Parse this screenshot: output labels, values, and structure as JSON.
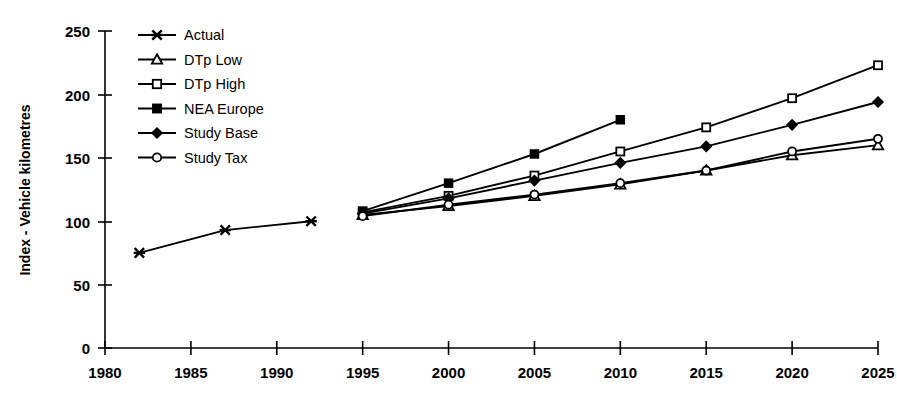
{
  "chart_data": {
    "type": "line",
    "title": "",
    "subtitle": "",
    "xlabel": "",
    "ylabel": "Index - Vehicle kilometres",
    "xlim": [
      1980,
      2025
    ],
    "ylim": [
      0,
      250
    ],
    "xticks": [
      1980,
      1985,
      1990,
      1995,
      2000,
      2005,
      2010,
      2015,
      2020,
      2025
    ],
    "yticks": [
      0,
      50,
      100,
      150,
      200,
      250
    ],
    "grid": false,
    "legend_position": "upper-left-inside",
    "series": [
      {
        "name": "Actual",
        "marker": "cross",
        "marker_style": "filled",
        "x": [
          1982,
          1987,
          1992
        ],
        "values": [
          75,
          93,
          100
        ]
      },
      {
        "name": "DTp Low",
        "marker": "triangle",
        "marker_style": "open",
        "x": [
          1995,
          2000,
          2005,
          2010,
          2015,
          2020,
          2025
        ],
        "values": [
          105,
          112,
          120,
          129,
          140,
          152,
          160
        ]
      },
      {
        "name": "DTp High",
        "marker": "square",
        "marker_style": "open",
        "x": [
          1995,
          2000,
          2005,
          2010,
          2015,
          2020,
          2025
        ],
        "values": [
          107,
          120,
          136,
          155,
          174,
          197,
          223
        ]
      },
      {
        "name": "NEA Europe",
        "marker": "square",
        "marker_style": "filled",
        "x": [
          1995,
          2000,
          2005,
          2010
        ],
        "values": [
          108,
          130,
          153,
          180
        ]
      },
      {
        "name": "Study Base",
        "marker": "diamond",
        "marker_style": "filled",
        "x": [
          1995,
          2000,
          2005,
          2010,
          2015,
          2020,
          2025
        ],
        "values": [
          106,
          118,
          132,
          146,
          159,
          176,
          194
        ]
      },
      {
        "name": "Study Tax",
        "marker": "circle",
        "marker_style": "open",
        "x": [
          1995,
          2000,
          2005,
          2010,
          2015,
          2020,
          2025
        ],
        "values": [
          104,
          113,
          121,
          130,
          140,
          155,
          165
        ]
      }
    ]
  },
  "axis": {
    "y_title": "Index - Vehicle kilometres",
    "y_tick_labels": [
      "250",
      "200",
      "150",
      "100",
      "50",
      "0"
    ],
    "x_tick_labels": [
      "1980",
      "1985",
      "1990",
      "1995",
      "2000",
      "2005",
      "2010",
      "2015",
      "2020",
      "2025"
    ]
  },
  "legend": {
    "items": [
      {
        "label": "Actual"
      },
      {
        "label": "DTp Low"
      },
      {
        "label": "DTp High"
      },
      {
        "label": "NEA Europe"
      },
      {
        "label": "Study Base"
      },
      {
        "label": "Study Tax"
      }
    ]
  },
  "colors": {
    "ink": "#000000",
    "background": "#ffffff",
    "marker_fill_open": "#ffffff"
  }
}
